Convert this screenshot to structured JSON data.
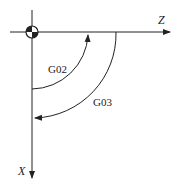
{
  "diagram": {
    "type": "cnc-arc-direction",
    "axes": {
      "horizontal": "Z",
      "vertical": "X"
    },
    "arcs": [
      {
        "label": "G02",
        "direction": "clockwise"
      },
      {
        "label": "G03",
        "direction": "counterclockwise"
      }
    ],
    "origin_symbol": "workpiece-zero"
  }
}
